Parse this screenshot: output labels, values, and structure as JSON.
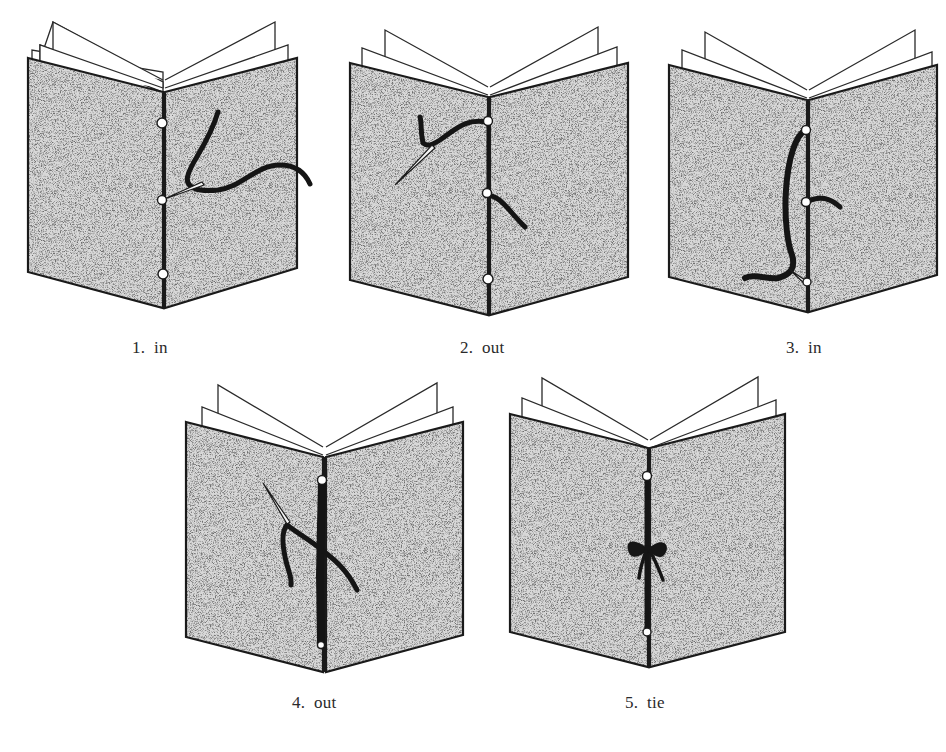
{
  "figure": {
    "type": "diagram",
    "steps": [
      {
        "number": "1.",
        "label": "in",
        "caption": "1.  in",
        "holes": 3,
        "thread_state": "needle enters middle hole from outside"
      },
      {
        "number": "2.",
        "label": "out",
        "caption": "2.  out",
        "holes": 3,
        "thread_state": "needle exits top hole"
      },
      {
        "number": "3.",
        "label": "in",
        "caption": "3.  in",
        "holes": 3,
        "thread_state": "thread passes down spine into bottom hole"
      },
      {
        "number": "4.",
        "label": "out",
        "caption": "4.  out",
        "holes": 3,
        "thread_state": "needle comes back out middle hole"
      },
      {
        "number": "5.",
        "label": "tie",
        "caption": "5.  tie",
        "holes": 3,
        "thread_state": "ends tied in a bow at middle hole"
      }
    ]
  },
  "colors": {
    "background": "#ffffff",
    "outline": "#1a1a1a",
    "cover_speckle_light": "#cfcfcf",
    "cover_speckle_dark": "#2b2b2b",
    "thread": "#151515",
    "page": "#ffffff"
  }
}
